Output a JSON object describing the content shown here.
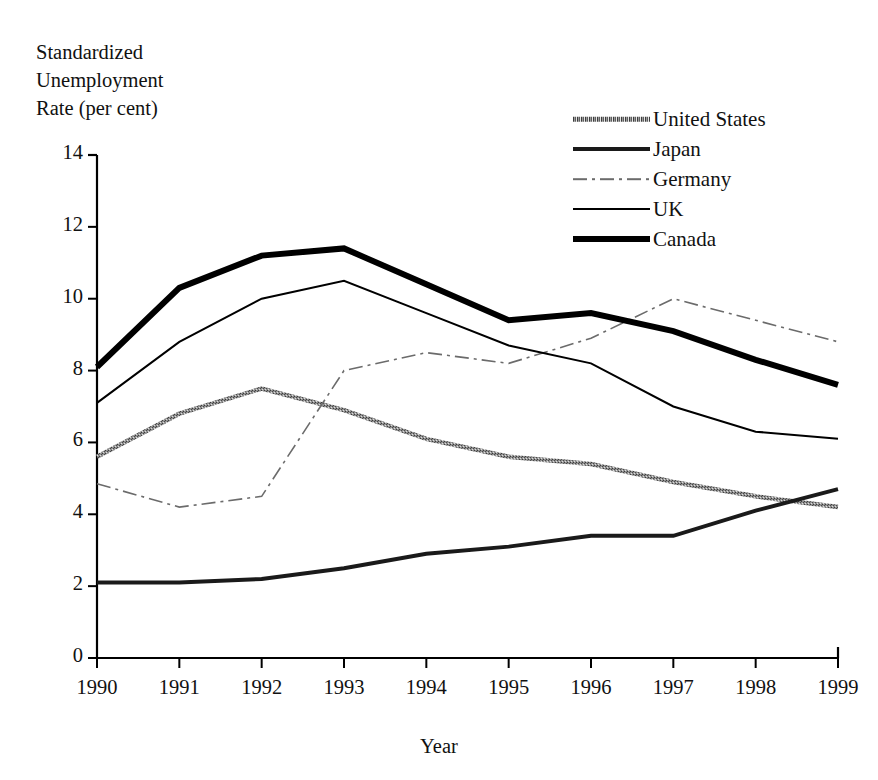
{
  "chart_data": {
    "type": "line",
    "title": "",
    "ylabel": "Standardized\nUnemployment\nRate (per cent)",
    "xlabel": "Year",
    "x": [
      1990,
      1991,
      1992,
      1993,
      1994,
      1995,
      1996,
      1997,
      1998,
      1999
    ],
    "xtick_labels": [
      "1990",
      "1991",
      "1992",
      "1993",
      "1994",
      "1995",
      "1996",
      "1997",
      "1998",
      "1999"
    ],
    "ytick_labels": [
      "0",
      "2",
      "4",
      "6",
      "8",
      "10",
      "12",
      "14"
    ],
    "yticks": [
      0,
      2,
      4,
      6,
      8,
      10,
      12,
      14
    ],
    "ylim": [
      0,
      14
    ],
    "xlim": [
      1990,
      1999
    ],
    "grid": false,
    "legend_position": "upper right",
    "series": [
      {
        "name": "United States",
        "values": [
          5.6,
          6.8,
          7.5,
          6.9,
          6.1,
          5.6,
          5.4,
          4.9,
          4.5,
          4.2
        ],
        "color": "#8a8a8a",
        "style": "stipple-thick",
        "width": 4.5,
        "dash": "none"
      },
      {
        "name": "Japan",
        "values": [
          2.1,
          2.1,
          2.2,
          2.5,
          2.9,
          3.1,
          3.4,
          3.4,
          4.1,
          4.7
        ],
        "color": "#1a1a1a",
        "style": "solid-medium",
        "width": 4.0,
        "dash": "none"
      },
      {
        "name": "Germany",
        "values": [
          4.85,
          4.2,
          4.5,
          8.0,
          8.5,
          8.2,
          8.9,
          10.0,
          9.4,
          8.8
        ],
        "color": "#6b6b6b",
        "style": "dash-dot-thin",
        "width": 1.6,
        "dash": "14,5,3,5"
      },
      {
        "name": "UK",
        "values": [
          7.1,
          8.8,
          10.0,
          10.5,
          9.6,
          8.7,
          8.2,
          7.0,
          6.3,
          6.1
        ],
        "color": "#000000",
        "style": "solid-thin",
        "width": 2.0,
        "dash": "none"
      },
      {
        "name": "Canada",
        "values": [
          8.1,
          10.3,
          11.2,
          11.4,
          10.4,
          9.4,
          9.6,
          9.1,
          8.3,
          7.6
        ],
        "color": "#000000",
        "style": "solid-thick",
        "width": 6.0,
        "dash": "none"
      }
    ]
  },
  "legend": {
    "entries": [
      {
        "label": "United States"
      },
      {
        "label": "Japan"
      },
      {
        "label": "Germany"
      },
      {
        "label": "UK"
      },
      {
        "label": "Canada"
      }
    ]
  },
  "axes": {
    "y_axis_title": "Standardized\nUnemployment\nRate (per cent)",
    "x_axis_title": "Year"
  }
}
